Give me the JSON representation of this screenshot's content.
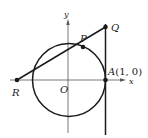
{
  "diagram": {
    "axes": {
      "x_label": "x",
      "y_label": "y",
      "origin_label": "O"
    },
    "circle": {
      "center": "O",
      "radius_label": "unit circle"
    },
    "points": {
      "P": {
        "label": "P"
      },
      "Q": {
        "label": "Q"
      },
      "R": {
        "label": "R"
      },
      "A": {
        "label_italic": "A",
        "label_coords": "(1, 0)"
      }
    },
    "lines": [
      "segment RQ through P",
      "vertical tangent line x = 1 through A and Q"
    ],
    "colors": {
      "stroke": "#1a1a1a",
      "background": "#ffffff"
    }
  }
}
